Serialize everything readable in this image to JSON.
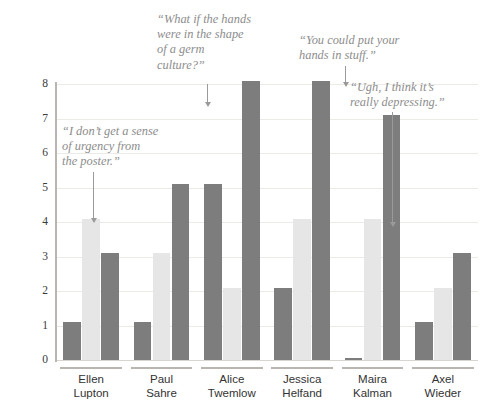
{
  "chart_data": {
    "type": "bar",
    "title": "",
    "subtitle": "",
    "xlabel": "",
    "ylabel": "",
    "ylim": [
      0,
      8
    ],
    "yticks": [
      0,
      1,
      2,
      3,
      4,
      5,
      6,
      7,
      8
    ],
    "grid": true,
    "legend": "none",
    "categories": [
      "Ellen Lupton",
      "Paul Sahre",
      "Alice Twemlow",
      "Jessica Helfand",
      "Maira Kalman",
      "Axel Wieder"
    ],
    "category_lines": [
      [
        "Ellen",
        "Lupton"
      ],
      [
        "Paul",
        "Sahre"
      ],
      [
        "Alice",
        "Twemlow"
      ],
      [
        "Jessica",
        "Helfand"
      ],
      [
        "Maira",
        "Kalman"
      ],
      [
        "Axel",
        "Wieder"
      ]
    ],
    "series": [
      {
        "name": "series-1",
        "color": "#7d7d7d",
        "values": [
          1.1,
          1.1,
          5.1,
          2.1,
          0.05,
          1.1
        ]
      },
      {
        "name": "series-2",
        "color": "#e6e6e6",
        "values": [
          4.1,
          3.1,
          2.1,
          4.1,
          4.1,
          2.1
        ]
      },
      {
        "name": "series-3",
        "color": "#7d7d7d",
        "values": [
          3.1,
          5.1,
          8.1,
          8.1,
          7.1,
          3.1
        ]
      }
    ],
    "annotations": [
      {
        "id": "annotation-urgency",
        "text": "“I don’t get a sense\n of urgency from\n the poster.”",
        "target_category": "Ellen Lupton",
        "target_series": "series-2",
        "target_value": 4.1
      },
      {
        "id": "annotation-germ-culture",
        "text": "“What if the hands\n were in the shape\n of a germ\n culture?”",
        "target_category": "Paul Sahre",
        "target_series": "series-3",
        "target_value": 5.1
      },
      {
        "id": "annotation-hands-in-stuff",
        "text": "“You could put your\n hands in stuff.”",
        "target_category": "Jessica Helfand",
        "target_series": "series-3",
        "target_value": 8.1
      },
      {
        "id": "annotation-depressing",
        "text": "“Ugh, I think it’s\n really depressing.”",
        "target_category": "Maira Kalman",
        "target_series": "series-2",
        "target_value": 4.1
      }
    ],
    "colors": {
      "dark_bar": "#7d7d7d",
      "light_bar": "#e6e6e6",
      "gridline": "#eceae6",
      "axis": "#b9b6b1",
      "tick_label": "#3b3b3b",
      "category_label": "#333333",
      "annotation_text": "#8d8d8d",
      "leader_line": "#9a9a9a",
      "background": "#ffffff"
    }
  }
}
